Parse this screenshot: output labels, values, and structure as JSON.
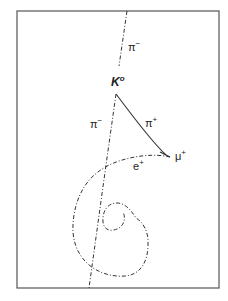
{
  "figure": {
    "frame": {
      "x": 17,
      "y": 11,
      "width": 202,
      "height": 277,
      "stroke": "#444444"
    },
    "ink_color": "#333333",
    "labels": {
      "pi_minus_top": {
        "base": "π",
        "sup": "−"
      },
      "k0": {
        "base": "K",
        "sup": "o"
      },
      "pi_minus_lower": {
        "base": "π",
        "sup": "−"
      },
      "pi_plus": {
        "base": "π",
        "sup": "+"
      },
      "mu_plus": {
        "base": "μ",
        "sup": "+"
      },
      "e_plus": {
        "base": "e",
        "sup": "+"
      }
    },
    "tracks": [
      {
        "name": "pi-minus-incoming",
        "style": "dash-dot"
      },
      {
        "name": "pi-minus-outgoing",
        "style": "dash-dot"
      },
      {
        "name": "pi-plus",
        "style": "solid"
      },
      {
        "name": "positron-spiral",
        "style": "dash-dot"
      }
    ]
  }
}
